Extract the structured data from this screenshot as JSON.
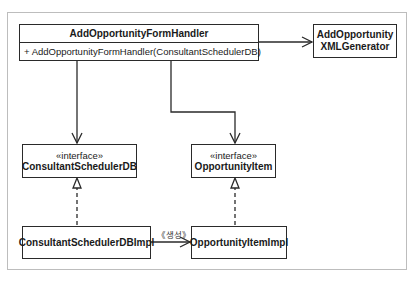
{
  "diagram": {
    "type": "UML class diagram",
    "classes": {
      "handler": {
        "name": "AddOpportunityFormHandler",
        "operations": [
          "+ AddOpportunityFormHandler(ConsultantSchedulerDB)"
        ]
      },
      "xml_generator": {
        "name_line1": "AddOpportunity",
        "name_line2": "XMLGenerator"
      },
      "consultant_scheduler_db": {
        "stereotype": "«interface»",
        "name": "ConsultantSchedulerDB"
      },
      "opportunity_item": {
        "stereotype": "«interface»",
        "name": "OpportunityItem"
      },
      "consultant_scheduler_db_impl": {
        "name": "ConsultantSchedulerDBImpl"
      },
      "opportunity_item_impl": {
        "name": "OpportunityItemImpl"
      }
    },
    "relationships": [
      {
        "from": "AddOpportunityFormHandler",
        "to": "AddOpportunityXMLGenerator",
        "kind": "association",
        "arrow": "open"
      },
      {
        "from": "AddOpportunityFormHandler",
        "to": "ConsultantSchedulerDB",
        "kind": "association",
        "arrow": "open"
      },
      {
        "from": "AddOpportunityFormHandler",
        "to": "OpportunityItem",
        "kind": "association",
        "arrow": "open"
      },
      {
        "from": "ConsultantSchedulerDBImpl",
        "to": "ConsultantSchedulerDB",
        "kind": "realization",
        "arrow": "hollow-triangle",
        "line": "dashed"
      },
      {
        "from": "OpportunityItemImpl",
        "to": "OpportunityItem",
        "kind": "realization",
        "arrow": "hollow-triangle",
        "line": "dashed"
      },
      {
        "from": "ConsultantSchedulerDBImpl",
        "to": "OpportunityItemImpl",
        "kind": "dependency",
        "label": "《생성》",
        "arrow": "open"
      }
    ],
    "edge_labels": {
      "create": "《생성》"
    },
    "colors": {
      "line": "#2a2a2a",
      "frame": "#bdbdbd",
      "background": "#ffffff"
    }
  }
}
